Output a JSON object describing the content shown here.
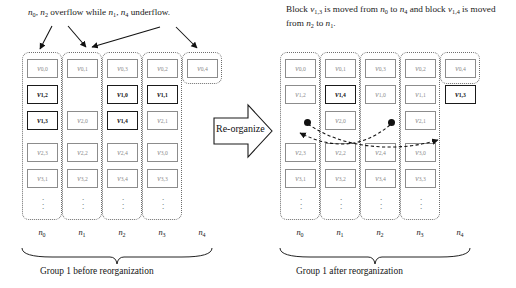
{
  "figure": {
    "left_panel": {
      "caption_top": "n0, n2 overflow while n1, n4 underflow.",
      "caption_top_parts": [
        {
          "base": "n",
          "sub": "0"
        },
        {
          "text": ", "
        },
        {
          "base": "n",
          "sub": "2"
        },
        {
          "text": " overflow while "
        },
        {
          "base": "n",
          "sub": "1"
        },
        {
          "text": ", "
        },
        {
          "base": "n",
          "sub": "4"
        },
        {
          "text": " underflow."
        }
      ],
      "group_caption": "Group 1 before reorganization",
      "node_labels": [
        "n0",
        "n1",
        "n2",
        "n3",
        "n4"
      ],
      "columns": [
        {
          "node": "n0",
          "cells": [
            {
              "v": "v",
              "i": "0,0",
              "bold": false
            },
            {
              "v": "v",
              "i": "1,2",
              "bold": true
            },
            {
              "v": "v",
              "i": "1,3",
              "bold": true
            },
            {
              "v": "v",
              "i": "2,3",
              "bold": false
            },
            {
              "v": "v",
              "i": "3,1",
              "bold": false
            }
          ]
        },
        {
          "node": "n1",
          "cells": [
            {
              "v": "v",
              "i": "0,1",
              "bold": false
            },
            null,
            {
              "v": "v",
              "i": "2,0",
              "bold": false
            },
            {
              "v": "v",
              "i": "2,2",
              "bold": false
            },
            {
              "v": "v",
              "i": "3,2",
              "bold": false
            }
          ]
        },
        {
          "node": "n2",
          "cells": [
            {
              "v": "v",
              "i": "0,3",
              "bold": false
            },
            {
              "v": "v",
              "i": "1,0",
              "bold": true
            },
            {
              "v": "v",
              "i": "1,4",
              "bold": true
            },
            {
              "v": "v",
              "i": "2,4",
              "bold": false
            },
            {
              "v": "v",
              "i": "3,4",
              "bold": false
            }
          ]
        },
        {
          "node": "n3",
          "cells": [
            {
              "v": "v",
              "i": "0,2",
              "bold": false
            },
            {
              "v": "v",
              "i": "1,1",
              "bold": true
            },
            {
              "v": "v",
              "i": "2,1",
              "bold": false
            },
            {
              "v": "v",
              "i": "3,0",
              "bold": false
            },
            {
              "v": "v",
              "i": "3,3",
              "bold": false
            }
          ]
        },
        {
          "node": "n4",
          "cells": [
            {
              "v": "v",
              "i": "0,4",
              "bold": false
            },
            null,
            null,
            null,
            null
          ]
        }
      ],
      "ellipsis_columns": [
        true,
        true,
        true,
        true,
        false
      ]
    },
    "right_panel": {
      "caption_top_line1": "Block v1,3 is moved from n0 to n4 and",
      "caption_top_line2": "block v1,4 is moved from n2 to n1.",
      "caption_top_parts": [
        {
          "text": "Block "
        },
        {
          "base": "v",
          "sub": "1,3"
        },
        {
          "text": " is moved from "
        },
        {
          "base": "n",
          "sub": "0"
        },
        {
          "text": " to "
        },
        {
          "base": "n",
          "sub": "4"
        },
        {
          "text": " and block "
        },
        {
          "base": "v",
          "sub": "1,4"
        },
        {
          "text": " is moved from "
        },
        {
          "base": "n",
          "sub": "2"
        },
        {
          "text": " to "
        },
        {
          "base": "n",
          "sub": "1"
        },
        {
          "text": "."
        }
      ],
      "group_caption": "Group 1 after reorganization",
      "node_labels": [
        "n0",
        "n1",
        "n2",
        "n3",
        "n4"
      ],
      "columns": [
        {
          "node": "n0",
          "cells": [
            {
              "v": "v",
              "i": "0,0",
              "bold": false
            },
            {
              "v": "v",
              "i": "1,2",
              "bold": false
            },
            null,
            {
              "v": "v",
              "i": "2,3",
              "bold": false
            },
            {
              "v": "v",
              "i": "3,1",
              "bold": false
            }
          ]
        },
        {
          "node": "n1",
          "cells": [
            {
              "v": "v",
              "i": "0,1",
              "bold": false
            },
            {
              "v": "v",
              "i": "1,4",
              "bold": true
            },
            {
              "v": "v",
              "i": "2,0",
              "bold": false
            },
            {
              "v": "v",
              "i": "2,2",
              "bold": false
            },
            {
              "v": "v",
              "i": "3,2",
              "bold": false
            }
          ]
        },
        {
          "node": "n2",
          "cells": [
            {
              "v": "v",
              "i": "0,3",
              "bold": false
            },
            {
              "v": "v",
              "i": "1,0",
              "bold": false
            },
            null,
            {
              "v": "v",
              "i": "2,4",
              "bold": false
            },
            {
              "v": "v",
              "i": "3,4",
              "bold": false
            }
          ]
        },
        {
          "node": "n3",
          "cells": [
            {
              "v": "v",
              "i": "0,2",
              "bold": false
            },
            {
              "v": "v",
              "i": "1,1",
              "bold": false
            },
            {
              "v": "v",
              "i": "2,1",
              "bold": false
            },
            {
              "v": "v",
              "i": "3,0",
              "bold": false
            },
            {
              "v": "v",
              "i": "3,3",
              "bold": false
            }
          ]
        },
        {
          "node": "n4",
          "cells": [
            {
              "v": "v",
              "i": "0,4",
              "bold": false
            },
            {
              "v": "v",
              "i": "1,3",
              "bold": true
            },
            null,
            null,
            null
          ]
        }
      ],
      "ellipsis_columns": [
        true,
        true,
        true,
        true,
        false
      ]
    },
    "center_arrow": {
      "label": "Re-organize"
    }
  }
}
